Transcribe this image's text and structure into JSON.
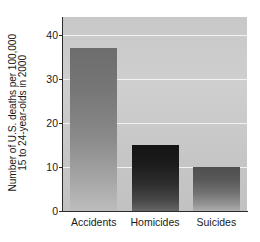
{
  "chart_data": {
    "type": "bar",
    "title": "",
    "subtitle": "",
    "xlabel": "",
    "ylabel_line1": "Number of U.S. deaths per 100,000",
    "ylabel_line2": "15 to 24-year-olds in 2000",
    "categories": [
      "Accidents",
      "Homicides",
      "Suicides"
    ],
    "values": [
      37,
      15,
      10
    ],
    "ylim": [
      0,
      44
    ],
    "yticks": [
      0,
      10,
      20,
      30,
      40
    ],
    "ytick_labels": [
      "0",
      "10",
      "20",
      "30",
      "40"
    ],
    "gridlines": [
      10,
      20,
      30,
      40
    ],
    "grid": true,
    "legend": "none",
    "colors": {
      "plot_background": "#c8c8c8",
      "gridline": "#f2f2f2",
      "axis": "#2b2b2b",
      "text": "#1a1a1a",
      "bar_accidents": "#8a8a8a",
      "bar_homicides": "#1c1c1c",
      "bar_suicides": "#737373"
    }
  }
}
